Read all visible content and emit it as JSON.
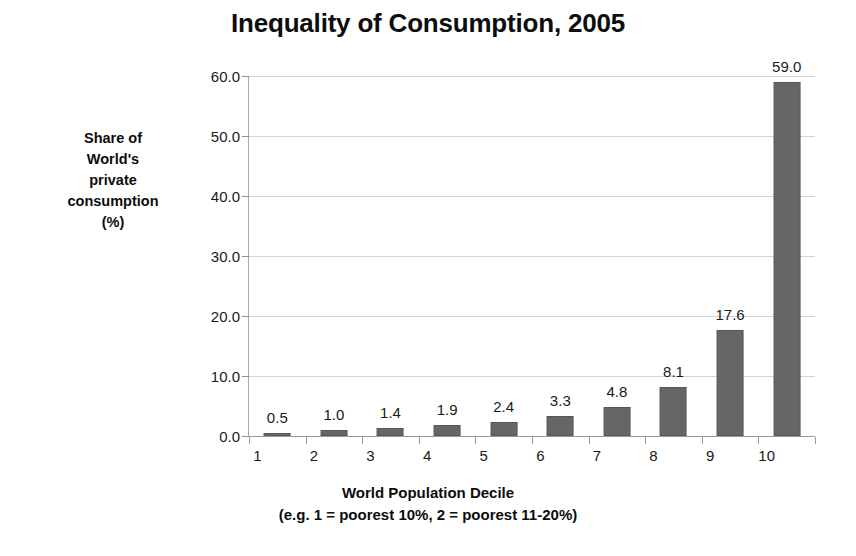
{
  "chart_data": {
    "type": "bar",
    "title": "Inequality of Consumption, 2005",
    "categories": [
      "1",
      "2",
      "3",
      "4",
      "5",
      "6",
      "7",
      "8",
      "9",
      "10"
    ],
    "values": [
      0.5,
      1.0,
      1.4,
      1.9,
      2.4,
      3.3,
      4.8,
      8.1,
      17.6,
      59.0
    ],
    "value_labels": [
      "0.5",
      "1.0",
      "1.4",
      "1.9",
      "2.4",
      "3.3",
      "4.8",
      "8.1",
      "17.6",
      "59.0"
    ],
    "ylabel": "Share of World's private consumption (%)",
    "ylabel_lines": [
      "Share of",
      "World's",
      "private",
      "consumption",
      "(%)"
    ],
    "xlabel": "World Population Decile",
    "xlabel_note": "(e.g. 1 = poorest 10%, 2 = poorest 11-20%)",
    "ylim": [
      0.0,
      60.0
    ],
    "ytick_labels": [
      "0.0",
      "10.0",
      "20.0",
      "30.0",
      "40.0",
      "50.0",
      "60.0"
    ],
    "ytick_values": [
      0.0,
      10.0,
      20.0,
      30.0,
      40.0,
      50.0,
      60.0
    ],
    "grid": true,
    "legend": "none",
    "bar_color": "#666666",
    "gridline_color": "#d2d2d2",
    "axis_color": "#a8a8a8",
    "background_color": "#ffffff",
    "text_color": "#1a1a1a"
  }
}
